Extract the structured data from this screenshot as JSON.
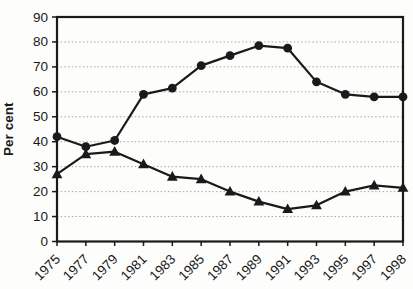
{
  "chart_data": {
    "type": "line",
    "title": "",
    "xlabel": "",
    "ylabel": "Per cent",
    "ylim": [
      0,
      90
    ],
    "ytick_step": 10,
    "grid": "horizontal dotted gridlines at every 10 units",
    "legend_position": "none",
    "line_color": "#1a1a1a",
    "gridline_color": "#a8a8a8",
    "categories": [
      "1975",
      "1977",
      "1979",
      "1981",
      "1983",
      "1985",
      "1987",
      "1989",
      "1991",
      "1993",
      "1995",
      "1997",
      "1998"
    ],
    "series": [
      {
        "name": "upper series",
        "marker": "circle",
        "values": [
          42,
          38,
          40.5,
          59,
          61.5,
          70.5,
          74.5,
          78.5,
          77.5,
          64,
          59,
          58,
          58
        ]
      },
      {
        "name": "lower series",
        "marker": "triangle",
        "values": [
          27,
          35,
          36,
          31,
          26,
          25,
          20,
          16,
          13,
          14.5,
          20,
          22.5,
          21.5
        ]
      }
    ]
  }
}
